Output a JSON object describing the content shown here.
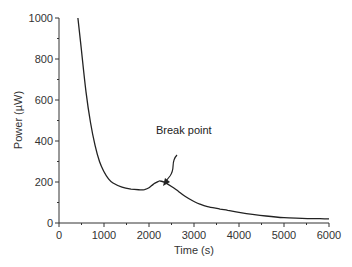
{
  "chart_data": {
    "type": "line",
    "title": "",
    "xlabel": "Time (s)",
    "ylabel": "Power (µW)",
    "xlim": [
      0,
      6000
    ],
    "ylim": [
      0,
      1000
    ],
    "xticks": [
      0,
      1000,
      2000,
      3000,
      4000,
      5000,
      6000
    ],
    "yticks": [
      0,
      200,
      400,
      600,
      800,
      1000
    ],
    "grid": false,
    "legend": null,
    "series": [
      {
        "name": "Power",
        "x": [
          420,
          500,
          600,
          700,
          800,
          900,
          1000,
          1100,
          1200,
          1400,
          1600,
          1800,
          1900,
          2000,
          2100,
          2200,
          2250,
          2350,
          2500,
          2650,
          2800,
          3000,
          3130,
          3300,
          3580,
          3750,
          4000,
          4300,
          4600,
          5000,
          5400,
          5800,
          6000
        ],
        "values": [
          1000,
          840,
          640,
          490,
          380,
          300,
          250,
          215,
          195,
          175,
          165,
          162,
          163,
          172,
          190,
          202,
          205,
          198,
          178,
          155,
          130,
          105,
          92,
          80,
          68,
          62,
          52,
          42,
          34,
          26,
          23,
          21,
          20
        ]
      }
    ],
    "annotations": [
      {
        "text": "Break point",
        "x": 2250,
        "y": 205,
        "arrow": true
      }
    ]
  },
  "labels": {
    "xlabel": "Time (s)",
    "ylabel": "Power (µW)",
    "annotation": "Break point"
  }
}
